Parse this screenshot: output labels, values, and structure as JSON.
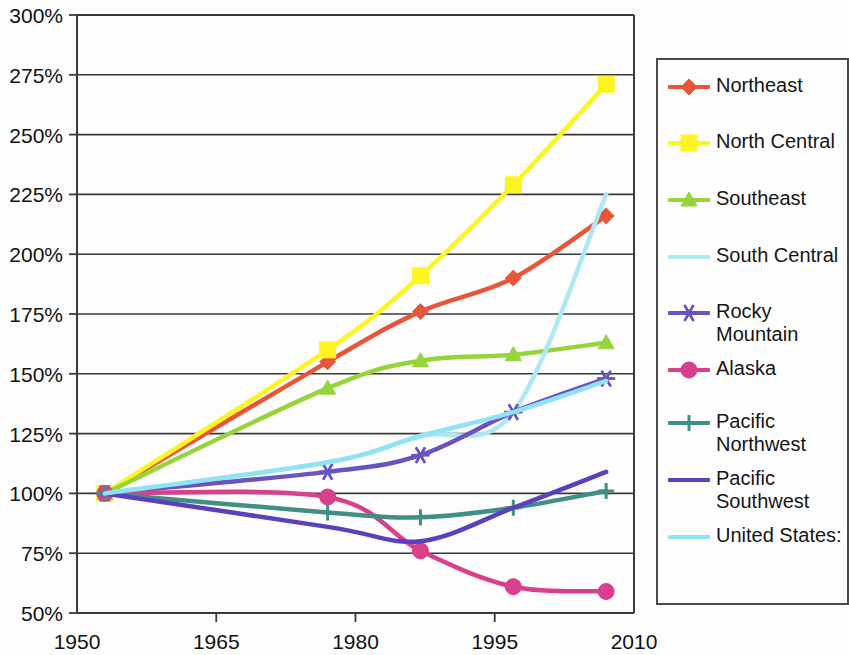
{
  "chart_data": {
    "type": "line",
    "title": "",
    "xlabel": "",
    "ylabel": "",
    "xlim": [
      1950,
      2010
    ],
    "ylim": [
      50,
      300
    ],
    "grid": true,
    "legend_position": "right",
    "x_ticks": [
      "1950",
      "1965",
      "1980",
      "1995",
      "2010"
    ],
    "x_tick_values": [
      1950,
      1965,
      1980,
      1995,
      2010
    ],
    "y_ticks": [
      "50%",
      "75%",
      "100%",
      "125%",
      "150%",
      "175%",
      "200%",
      "225%",
      "250%",
      "275%",
      "300%"
    ],
    "y_tick_values": [
      50,
      75,
      100,
      125,
      150,
      175,
      200,
      225,
      250,
      275,
      300
    ],
    "x": [
      1953,
      1977,
      1987,
      1997,
      2007
    ],
    "series": [
      {
        "name": "Northeast",
        "color": "#e8563a",
        "marker": "diamond",
        "values": [
          100,
          155,
          176,
          190,
          216
        ]
      },
      {
        "name": "North Central",
        "color": "#fdf521",
        "marker": "square",
        "values": [
          100,
          160,
          191,
          229,
          271
        ]
      },
      {
        "name": "Southeast",
        "color": "#96d43a",
        "marker": "triangle",
        "values": [
          100,
          144,
          155.5,
          158,
          163
        ]
      },
      {
        "name": "South Central",
        "color": "#aee8f2",
        "marker": "none",
        "values": [
          100,
          113,
          124,
          134,
          225
        ]
      },
      {
        "name": "Rocky Mountain",
        "color": "#6a52c0",
        "marker": "asterisk",
        "values": [
          100,
          109,
          116,
          134,
          148
        ]
      },
      {
        "name": "Alaska",
        "color": "#d9408c",
        "marker": "circle",
        "values": [
          100,
          98.5,
          76,
          61,
          59
        ]
      },
      {
        "name": "Pacific\nNorthwest",
        "color": "#3f8f86",
        "marker": "plus",
        "values": [
          100,
          92,
          90,
          94,
          101
        ]
      },
      {
        "name": "Pacific\nSouthwest",
        "color": "#5a3fbf",
        "marker": "none",
        "values": [
          100,
          86,
          80,
          94,
          109
        ]
      },
      {
        "name": "United States:",
        "color": "#8fe3f5",
        "marker": "none",
        "values": [
          100,
          113,
          124,
          134,
          147
        ]
      }
    ]
  },
  "legend": {
    "items": [
      {
        "label": "Northeast"
      },
      {
        "label": "North Central"
      },
      {
        "label": "Southeast"
      },
      {
        "label": "South Central"
      },
      {
        "label": "Rocky Mountain"
      },
      {
        "label": "Alaska"
      },
      {
        "label": "Pacific\nNorthwest"
      },
      {
        "label": "Pacific\nSouthwest"
      },
      {
        "label": "United States:"
      }
    ]
  }
}
